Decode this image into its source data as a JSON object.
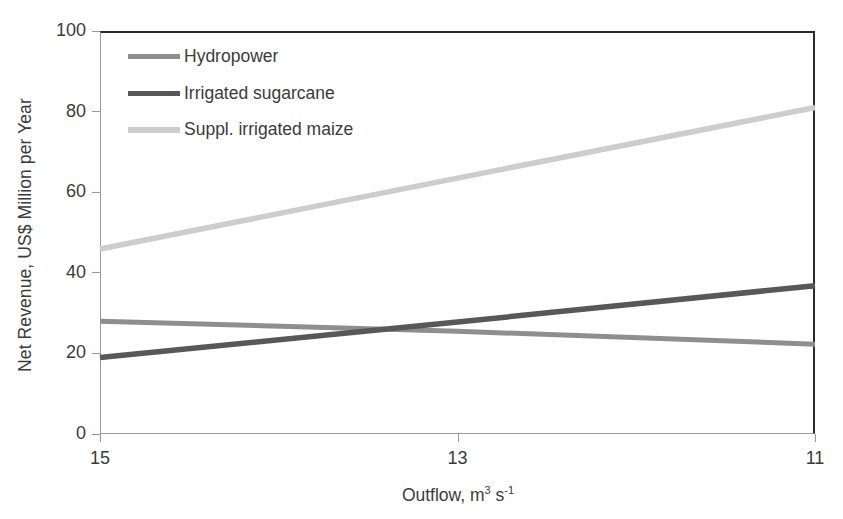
{
  "chart_data": {
    "type": "line",
    "title": "",
    "xlabel": "Outflow, m³ s⁻¹",
    "xlabel_base": "Outflow, m",
    "xlabel_sup1": "3",
    "xlabel_mid": " s",
    "xlabel_sup2": "-1",
    "ylabel": "Net Revenue, US$ Million per Year",
    "x": [
      15,
      13,
      11
    ],
    "xticks": [
      "15",
      "13",
      "11"
    ],
    "xlim": [
      15,
      11
    ],
    "yticks": [
      "0",
      "20",
      "40",
      "60",
      "80",
      "100"
    ],
    "ylim": [
      0,
      100
    ],
    "grid": false,
    "legend_position": "upper-left-inside",
    "series": [
      {
        "name": "Hydropower",
        "color": "#8e8e8e",
        "width": 5,
        "values": [
          28.0,
          25.5,
          22.3
        ]
      },
      {
        "name": "Irrigated sugarcane",
        "color": "#585858",
        "width": 5.5,
        "values": [
          19.0,
          27.8,
          36.8
        ]
      },
      {
        "name": "Suppl. irrigated maize",
        "color": "#cdcdcd",
        "width": 5.5,
        "values": [
          45.9,
          63.5,
          81.0
        ]
      }
    ]
  },
  "axes": {
    "frame_color": "#2b2b2b",
    "tick_color": "#9a9a9a",
    "text_color": "#3b3b3b"
  }
}
